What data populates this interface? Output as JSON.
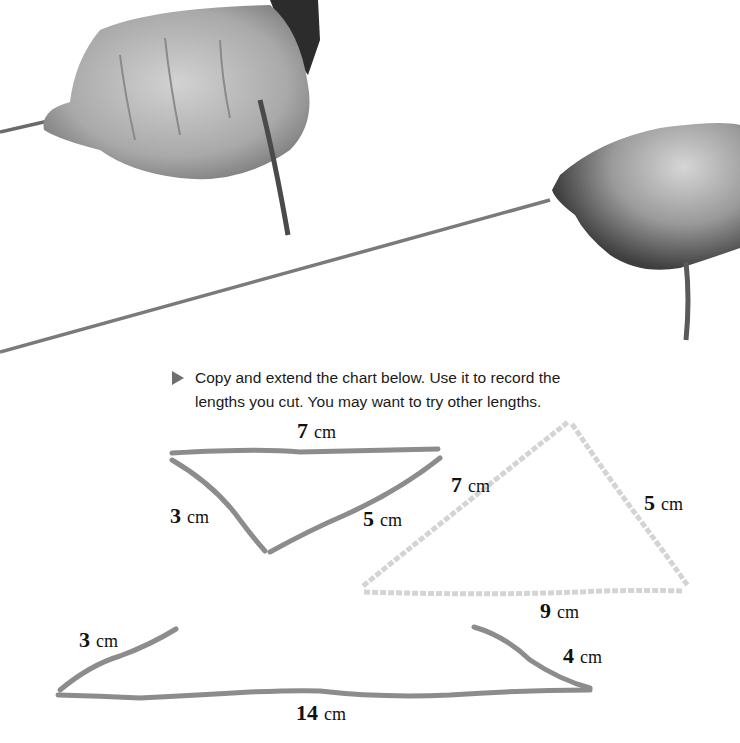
{
  "photo": {
    "description": "Two hands stretching a rope taut",
    "rope_color": "#7a7a7a",
    "skin_color_light": "#d8d8d8",
    "skin_color_dark": "#6a6a6a"
  },
  "instruction": {
    "bullet_icon": "right-triangle-arrow",
    "line1": "Copy and extend the chart below. Use it to record the",
    "line2": "lengths you cut. You may want to try other lengths."
  },
  "diagrams": [
    {
      "name": "triangle-attempt-7-3-5",
      "style": "dark rope (does not close)",
      "sides": [
        {
          "value": "7",
          "unit": "cm"
        },
        {
          "value": "3",
          "unit": "cm"
        },
        {
          "value": "5",
          "unit": "cm"
        }
      ]
    },
    {
      "name": "triangle-7-5-9",
      "style": "light dashed rope (closed triangle)",
      "sides": [
        {
          "value": "7",
          "unit": "cm"
        },
        {
          "value": "5",
          "unit": "cm"
        },
        {
          "value": "9",
          "unit": "cm"
        }
      ]
    },
    {
      "name": "triangle-attempt-3-4-14",
      "style": "dark rope (does not close)",
      "sides": [
        {
          "value": "3",
          "unit": "cm"
        },
        {
          "value": "4",
          "unit": "cm"
        },
        {
          "value": "14",
          "unit": "cm"
        }
      ]
    }
  ],
  "colors": {
    "rope_dark": "#8c8c8c",
    "rope_light": "#d4d4d4",
    "text": "#111111",
    "bullet": "#6f6f6f"
  }
}
